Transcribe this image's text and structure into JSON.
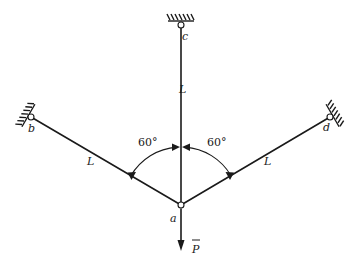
{
  "diagram": {
    "title": "",
    "type": "three-bar truss with concentrated load",
    "nodes": [
      {
        "id": "a",
        "label": "a",
        "support": "none"
      },
      {
        "id": "b",
        "label": "b",
        "support": "fixed-pin"
      },
      {
        "id": "c",
        "label": "c",
        "support": "fixed-pin"
      },
      {
        "id": "d",
        "label": "d",
        "support": "fixed-pin"
      }
    ],
    "members": [
      {
        "from": "a",
        "to": "b",
        "length_label": "L"
      },
      {
        "from": "a",
        "to": "c",
        "length_label": "L"
      },
      {
        "from": "a",
        "to": "d",
        "length_label": "L"
      }
    ],
    "angles": [
      {
        "between": [
          "a-b",
          "a-c"
        ],
        "label": "60°"
      },
      {
        "between": [
          "a-c",
          "a-d"
        ],
        "label": "60°"
      }
    ],
    "load": {
      "at": "a",
      "label": "P",
      "direction": "down",
      "vector_bar": true
    },
    "colors": {
      "ink": "#1a1a1a",
      "background": "#ffffff"
    }
  }
}
